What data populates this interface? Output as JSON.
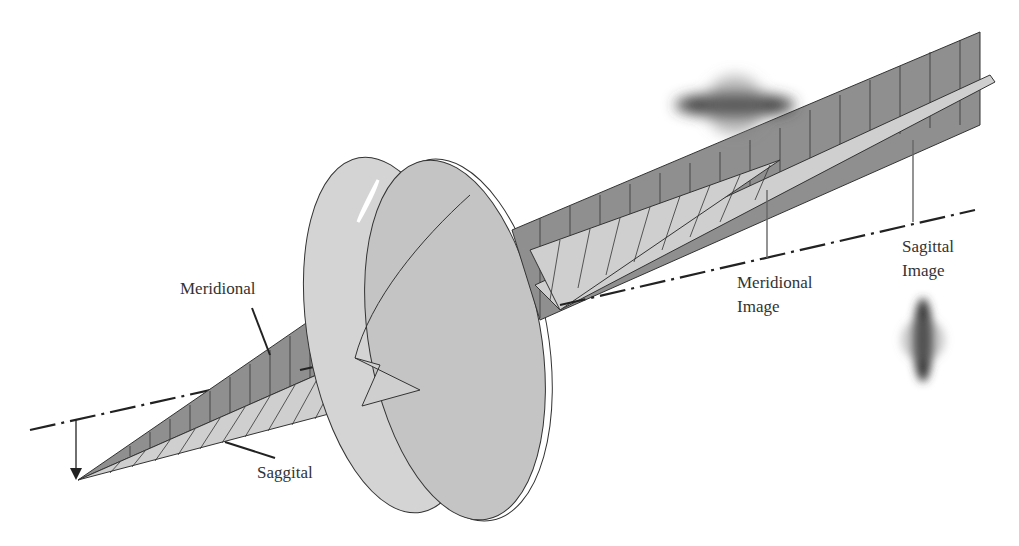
{
  "diagram": {
    "labels": {
      "meridional": "Meridional",
      "saggital": "Saggital",
      "meridional_image_line1": "Meridional",
      "meridional_image_line2": "Image",
      "sagittal_image_line1": "Sagittal",
      "sagittal_image_line2": "Image"
    },
    "colors": {
      "meridional_fan": "#8f8f8f",
      "sagittal_fan": "#cfcfcf",
      "lens_back": "#d4d4d4",
      "lens_front": "#c4c4c4",
      "spot": "#3a3a3a",
      "line": "#222222"
    }
  }
}
